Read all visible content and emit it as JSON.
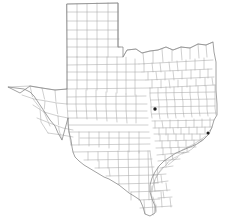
{
  "map": {
    "title": "Texas County Map",
    "subject": "Texas",
    "region_type": "U.S. state with county subdivisions",
    "width_px": 226,
    "height_px": 224,
    "background_color": "#ffffff",
    "county_line_color": "#a8a8a8",
    "state_outline_color": "#8a8a8a",
    "marker_color": "#1d1d1d",
    "labels_visible": "none",
    "legend_visible": "none",
    "scale_bar_visible": "none",
    "compass_visible": "none"
  },
  "markers": [
    {
      "name": "marker-central-east",
      "x": 155,
      "y": 109,
      "radius": 1.7,
      "color": "#1d1d1d"
    },
    {
      "name": "marker-upper-coast",
      "x": 208,
      "y": 133,
      "radius": 1.5,
      "color": "#1d1d1d"
    }
  ],
  "regions": [
    {
      "name": "panhandle",
      "note": "regular grid of square counties, north"
    },
    {
      "name": "west-texas",
      "note": "large sparse counties, Big Bend"
    },
    {
      "name": "central-texas",
      "note": "medium irregular counties"
    },
    {
      "name": "east-texas",
      "note": "dense small irregular counties"
    },
    {
      "name": "gulf-coast",
      "note": "barrier islands and bays along southeast edge"
    },
    {
      "name": "rio-grande-valley",
      "note": "southern tip counties"
    }
  ],
  "borders": [
    {
      "name": "north-border-oklahoma",
      "type": "state-line"
    },
    {
      "name": "east-border-louisiana",
      "type": "state-line"
    },
    {
      "name": "west-border-new-mexico",
      "type": "state-line"
    },
    {
      "name": "southwest-border-mexico",
      "type": "international-river"
    },
    {
      "name": "southeast-coastline-gulf",
      "type": "coastline"
    }
  ]
}
